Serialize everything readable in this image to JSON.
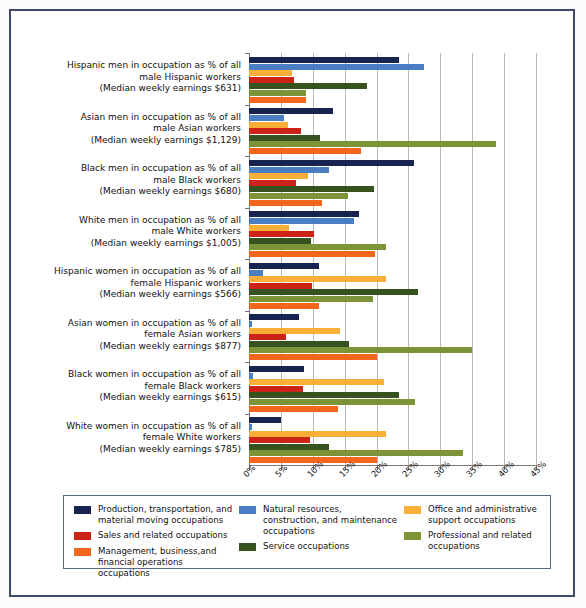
{
  "chart_data": {
    "type": "bar",
    "orientation": "horizontal-grouped",
    "title": "",
    "xlabel": "",
    "ylabel": "",
    "xlim": [
      0,
      45
    ],
    "xtick_labels": [
      "0%",
      "5%",
      "10%",
      "15%",
      "20%",
      "25%",
      "30%",
      "35%",
      "40%",
      "45%"
    ],
    "xticks": [
      0,
      5,
      10,
      15,
      20,
      25,
      30,
      35,
      40,
      45
    ],
    "grid": true,
    "legend_position": "bottom",
    "categories": [
      {
        "lines": [
          "Hispanic men in occupation as % of all",
          "male Hispanic workers",
          "(Median weekly earnings $631)"
        ]
      },
      {
        "lines": [
          "Asian men in occupation as % of all",
          "male Asian workers",
          "(Median weekly earnings $1,129)"
        ]
      },
      {
        "lines": [
          "Black men in occupation as % of all",
          "male Black workers",
          "(Median weekly earnings $680)"
        ]
      },
      {
        "lines": [
          "White men in occupation as % of all",
          "male White workers",
          "(Median weekly earnings $1,005)"
        ]
      },
      {
        "lines": [
          "Hispanic women in occupation as % of all",
          "female Hispanic workers",
          "(Median weekly earnings $566)"
        ]
      },
      {
        "lines": [
          "Asian women in occupation as % of all",
          "female Asian workers",
          "(Median weekly earnings $877)"
        ]
      },
      {
        "lines": [
          "Black women in occupation as % of all",
          "female Black workers",
          "(Median weekly earnings $615)"
        ]
      },
      {
        "lines": [
          "White women in occupation as % of all",
          "female White workers",
          "(Median weekly earnings $785)"
        ]
      }
    ],
    "series": [
      {
        "name": "Production, transportation, and material moving occupations",
        "color": "#17244f",
        "values": [
          23.5,
          13.2,
          25.8,
          17.3,
          11.0,
          7.9,
          8.7,
          5.0
        ]
      },
      {
        "name": "Natural resources, construction, and maintenance occupations",
        "color": "#4a7ec2",
        "values": [
          27.5,
          5.5,
          12.6,
          16.4,
          2.2,
          0.5,
          0.7,
          0.4
        ]
      },
      {
        "name": "Office and administrative support occupations",
        "color": "#f9ae38",
        "values": [
          6.8,
          6.1,
          9.3,
          6.3,
          21.5,
          14.2,
          21.1,
          21.5
        ]
      },
      {
        "name": "Sales and related occupations",
        "color": "#cc2317",
        "values": [
          7.0,
          8.1,
          7.4,
          10.2,
          9.8,
          5.8,
          8.5,
          9.5
        ]
      },
      {
        "name": "Service occupations",
        "color": "#36531f",
        "values": [
          18.5,
          11.2,
          19.6,
          9.7,
          26.5,
          15.7,
          23.5,
          12.5
        ]
      },
      {
        "name": "Professional and related occupations",
        "color": "#7d9338",
        "values": [
          9.0,
          38.8,
          15.5,
          21.5,
          19.5,
          35.0,
          26.0,
          33.6
        ]
      },
      {
        "name": "Management, business,and financial operations occupations",
        "color": "#f4661b",
        "values": [
          9.0,
          17.6,
          11.5,
          19.7,
          11.0,
          20.1,
          14.0,
          20.0
        ]
      }
    ]
  },
  "legend": {
    "columns": [
      {
        "items": [
          {
            "color": "#17244f",
            "label": "Production, transportation, and material moving occupations",
            "icon": "legend-swatch-production"
          },
          {
            "color": "#cc2317",
            "label": "Sales and related occupations",
            "icon": "legend-swatch-sales"
          },
          {
            "color": "#f4661b",
            "label": "Management, business,and financial operations occupations",
            "icon": "legend-swatch-management"
          }
        ]
      },
      {
        "items": [
          {
            "color": "#4a7ec2",
            "label": "Natural resources, construction, and maintenance occupations",
            "icon": "legend-swatch-natural-resources"
          },
          {
            "color": "#36531f",
            "label": "Service occupations",
            "icon": "legend-swatch-service"
          }
        ]
      },
      {
        "items": [
          {
            "color": "#f9ae38",
            "label": "Office and administrative support occupations",
            "icon": "legend-swatch-office"
          },
          {
            "color": "#7d9338",
            "label": "Professional and related occupations",
            "icon": "legend-swatch-professional"
          }
        ]
      }
    ]
  },
  "colors": {
    "frame_border": "#3c4a6b",
    "gridline": "#b9b9b9",
    "axis": "#7b7b7b",
    "page_background": "#fdfcfa"
  }
}
